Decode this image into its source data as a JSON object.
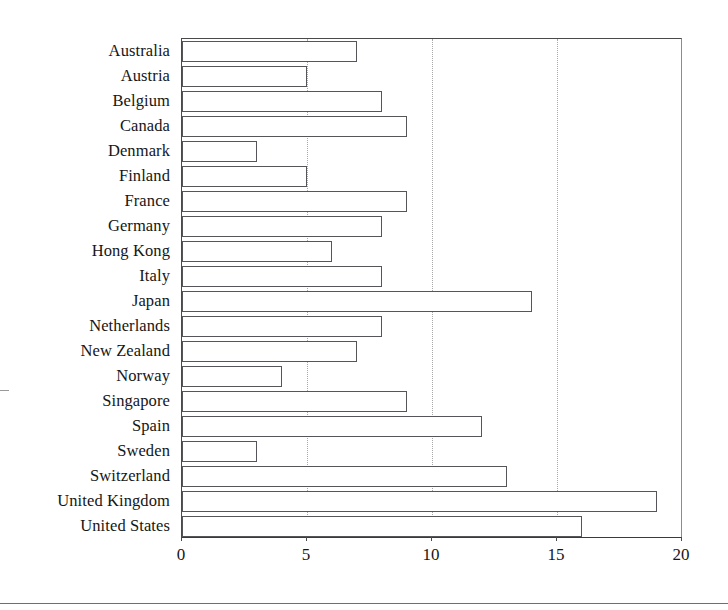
{
  "chart_data": {
    "type": "bar",
    "orientation": "horizontal",
    "title": "",
    "subtitle": "",
    "xlabel": "",
    "ylabel": "",
    "xlim": [
      0,
      20
    ],
    "ylim": null,
    "xticks": [
      0,
      5,
      10,
      15,
      20
    ],
    "xtick_labels": [
      "0",
      "5",
      "10",
      "15",
      "20"
    ],
    "grid": "vertical dotted gridlines at 5, 10, 15",
    "gridlines_at": [
      5,
      10,
      15
    ],
    "legend": null,
    "legend_position": "none",
    "bar_style": {
      "fill": "#ffffff",
      "edge": "#55555a",
      "edge_width": 1.2
    },
    "categories": [
      "Australia",
      "Austria",
      "Belgium",
      "Canada",
      "Denmark",
      "Finland",
      "France",
      "Germany",
      "Hong Kong",
      "Italy",
      "Japan",
      "Netherlands",
      "New Zealand",
      "Norway",
      "Singapore",
      "Spain",
      "Sweden",
      "Switzerland",
      "United Kingdom",
      "United States"
    ],
    "values": [
      7,
      5,
      8,
      9,
      3,
      5,
      9,
      8,
      6,
      8,
      14,
      8,
      7,
      4,
      9,
      12,
      3,
      13,
      19,
      16
    ]
  }
}
